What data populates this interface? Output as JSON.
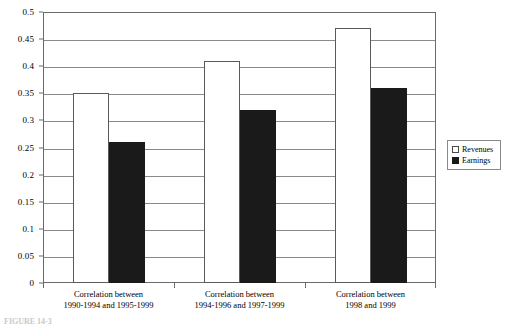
{
  "chart_data": {
    "type": "bar",
    "title": "",
    "xlabel": "",
    "ylabel": "",
    "ylim": [
      0,
      0.5
    ],
    "ytick_values": [
      0,
      0.05,
      0.1,
      0.15,
      0.2,
      0.25,
      0.3,
      0.35,
      0.4,
      0.45,
      0.5
    ],
    "ytick_labels": [
      "0",
      "0.05",
      "0.1",
      "0.15",
      "0.2",
      "0.25",
      "0.3",
      "0.35",
      "0.4",
      "0.45",
      "0.5"
    ],
    "grid": true,
    "grid_axis": "y",
    "legend_position": "right outside",
    "categories": [
      "Correlation between 1990-1994 and 1995-1999",
      "Correlation between 1994-1996 and 1997-1999",
      "Correlation between 1998 and 1999"
    ],
    "category_label_lines": [
      [
        "Correlation between",
        "1990-1994 and 1995-1999"
      ],
      [
        "Correlation between",
        "1994-1996 and 1997-1999"
      ],
      [
        "Correlation between",
        "1998 and 1999"
      ]
    ],
    "series": [
      {
        "name": "Revenues",
        "color": "#ffffff",
        "edge_color": "#5a5a5a",
        "values": [
          0.35,
          0.41,
          0.47
        ]
      },
      {
        "name": "Earnings",
        "color": "#1a1a1a",
        "edge_color": "#1a1a1a",
        "values": [
          0.26,
          0.32,
          0.36
        ]
      }
    ]
  },
  "legend": {
    "items": [
      {
        "label": "Revenues",
        "swatch": "revenues"
      },
      {
        "label": "Earnings",
        "swatch": "earnings"
      }
    ]
  },
  "caption": {
    "text": "FIGURE 14-3"
  }
}
